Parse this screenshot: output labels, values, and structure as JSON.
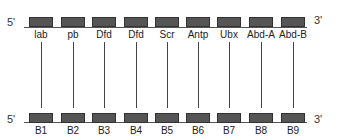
{
  "top_cluster": {
    "five_prime": "5'",
    "three_prime": "3'",
    "genes": [
      "lab",
      "pb",
      "Dfd",
      "Dfd",
      "Scr",
      "Antp",
      "Ubx",
      "Abd-A",
      "Abd-B"
    ]
  },
  "bottom_cluster": {
    "five_prime": "5'",
    "three_prime": "3'",
    "genes": [
      "B1",
      "B2",
      "B3",
      "B4",
      "B5",
      "B6",
      "B7",
      "B8",
      "B9"
    ]
  },
  "colors": {
    "box_fill": "#555555",
    "line": "#555555"
  }
}
